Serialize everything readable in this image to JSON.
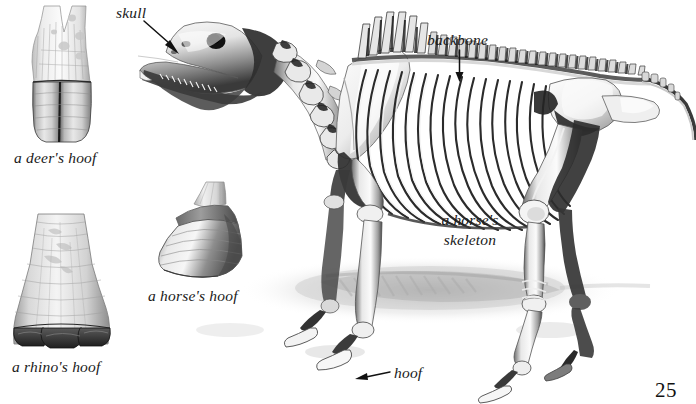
{
  "page": {
    "number": "25",
    "background_color": "#ffffff",
    "ink_color": "#111111",
    "width": 696,
    "height": 404
  },
  "figures": [
    {
      "id": "deer-hoof",
      "kind": "illustration",
      "subject": "a deer's hoof",
      "caption": "a deer's hoof",
      "caption_x": 14,
      "caption_y": 148,
      "art_x": 22,
      "art_y": 6,
      "art_w": 78,
      "art_h": 136
    },
    {
      "id": "rhino-hoof",
      "kind": "illustration",
      "subject": "a rhino's hoof",
      "caption": "a rhino's hoof",
      "caption_x": 12,
      "caption_y": 357,
      "art_x": 6,
      "art_y": 210,
      "art_w": 106,
      "art_h": 142
    },
    {
      "id": "horse-hoof",
      "kind": "illustration",
      "subject": "a horse's hoof",
      "caption": "a horse's hoof",
      "caption_x": 148,
      "caption_y": 286,
      "art_x": 152,
      "art_y": 182,
      "art_w": 96,
      "art_h": 100
    },
    {
      "id": "horse-skeleton",
      "kind": "illustration",
      "subject": "a horse's skeleton",
      "caption": "a horse's\nskeleton",
      "caption_x": 432,
      "caption_y": 210,
      "art_x": 140,
      "art_y": 8,
      "art_w": 556,
      "art_h": 386
    }
  ],
  "labels": [
    {
      "id": "skull",
      "text": "skull",
      "x": 116,
      "y": 3,
      "pointer": "arrow-down-right",
      "arrow_from_x": 144,
      "arrow_from_y": 21,
      "arrow_to_x": 177,
      "arrow_to_y": 50
    },
    {
      "id": "backbone",
      "text": "backbone",
      "x": 427,
      "y": 30,
      "pointer": "arrow-down",
      "arrow_from_x": 459,
      "arrow_from_y": 50,
      "arrow_to_x": 459,
      "arrow_to_y": 81
    },
    {
      "id": "hoof",
      "text": "hoof",
      "x": 394,
      "y": 363,
      "pointer": "arrow-left",
      "arrow_from_x": 389,
      "arrow_from_y": 375,
      "arrow_to_x": 356,
      "arrow_to_y": 379
    }
  ]
}
